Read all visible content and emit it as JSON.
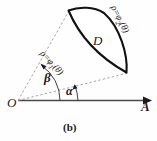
{
  "figure": {
    "caption": "(b)",
    "region_label": "D",
    "origin_label": "O",
    "axis_label": "A",
    "angle_inner_label": "α",
    "angle_outer_label": "β",
    "curve_inner": {
      "lhs": "ρ=φ",
      "sub": "1",
      "arg": "(θ)"
    },
    "curve_outer": {
      "lhs": "ρ=φ",
      "sub": "2",
      "arg": "(θ)"
    },
    "colors": {
      "stroke": "#1a1a1a",
      "dashed": "#8a8a8a",
      "axis": "#4a4a4a",
      "background": "#fefefe"
    }
  }
}
